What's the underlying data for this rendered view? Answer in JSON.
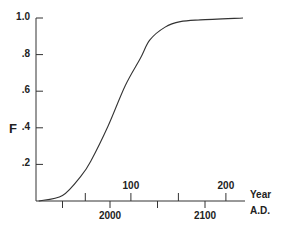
{
  "chart_data": {
    "type": "line",
    "title": "",
    "ylabel": "F",
    "xlabel": "Year A.D.",
    "xlabel_lines": [
      "Year",
      "A.D."
    ],
    "ylim": [
      0,
      1.0
    ],
    "xlim": [
      1925,
      2140
    ],
    "grid": false,
    "legend": null,
    "y_ticks": [
      {
        "value": 0.2,
        "label": ".2"
      },
      {
        "value": 0.4,
        "label": ".4"
      },
      {
        "value": 0.6,
        "label": ".6"
      },
      {
        "value": 0.8,
        "label": ".8"
      },
      {
        "value": 1.0,
        "label": "1.0"
      }
    ],
    "x_ticks_bottom": [
      {
        "value": 1950,
        "label": ""
      },
      {
        "value": 2000,
        "label": "2000"
      },
      {
        "value": 2050,
        "label": ""
      },
      {
        "value": 2100,
        "label": "2100"
      }
    ],
    "x_ticks_top_secondary": [
      {
        "position_year": 1974,
        "label": ""
      },
      {
        "position_year": 2022,
        "label": "100"
      },
      {
        "position_year": 2072,
        "label": ""
      },
      {
        "position_year": 2122,
        "label": "200"
      }
    ],
    "series": [
      {
        "name": "F",
        "x": [
          1925,
          1950,
          1970,
          1980,
          1998,
          2016,
          2032,
          2042,
          2058,
          2074,
          2095,
          2140
        ],
        "y": [
          0.0,
          0.03,
          0.14,
          0.22,
          0.41,
          0.63,
          0.78,
          0.88,
          0.95,
          0.98,
          0.99,
          1.0
        ]
      }
    ]
  }
}
